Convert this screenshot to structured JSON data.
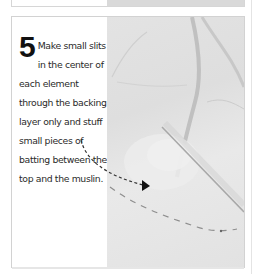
{
  "step": {
    "number": "5",
    "text": "Make small slits in the center of each element through the backing layer only and stuff small pieces of batting between the top and the muslin."
  },
  "colors": {
    "text": "#2a2a2a",
    "number": "#111111",
    "photo_bg": "#e0e0e0",
    "border": "#d2d2d2"
  },
  "icons": {
    "pointer": "dashed-arrow-icon"
  }
}
